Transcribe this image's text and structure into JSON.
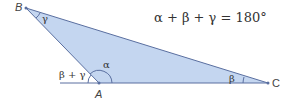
{
  "diagram": {
    "equation": "α + β + γ = 180°",
    "vertices": {
      "A": "A",
      "B": "B",
      "C": "C"
    },
    "angles": {
      "alpha": "α",
      "beta": "β",
      "gamma": "γ",
      "exterior": "β + γ"
    },
    "colors": {
      "fill": "#c4d6f0",
      "stroke": "#5a6fa0",
      "text": "#333333"
    }
  }
}
